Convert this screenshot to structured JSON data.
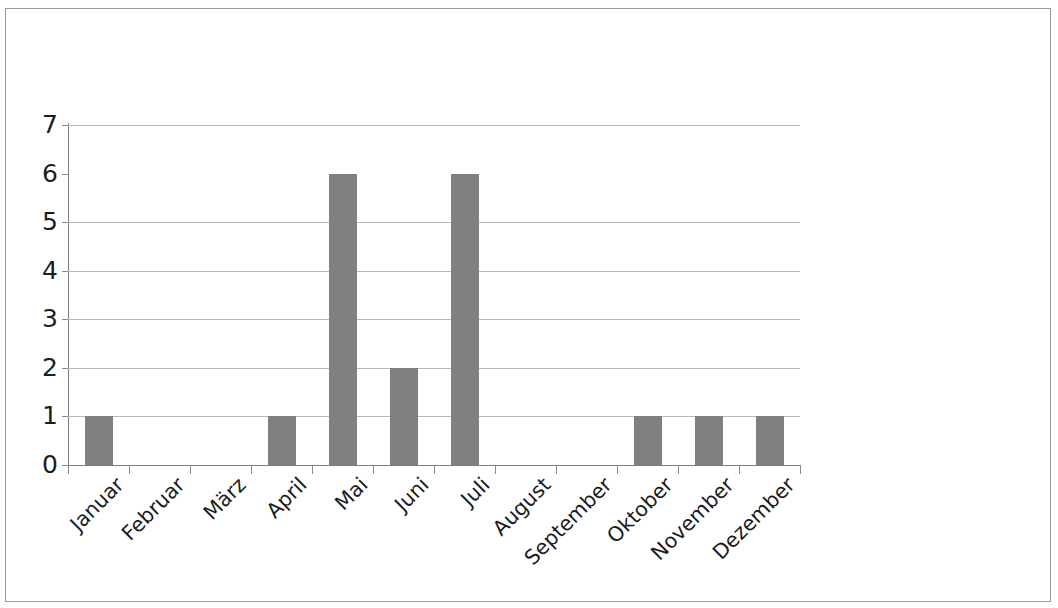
{
  "figure": {
    "background_color": "#ffffff",
    "frame_color": "#9a9a9a",
    "bar_color": "#808080",
    "axis_color": "#7d7d7d",
    "gridline_color": "#b9b9b9",
    "text_color": "#1d1d1d"
  },
  "chart_data": {
    "type": "bar",
    "title": "",
    "subtitle": "",
    "xlabel": "",
    "ylabel": "",
    "categories": [
      "Januar",
      "Februar",
      "März",
      "April",
      "Mai",
      "Juni",
      "Juli",
      "August",
      "September",
      "Oktober",
      "November",
      "Dezember"
    ],
    "values": [
      1,
      0,
      0,
      1,
      6,
      2,
      6,
      0,
      0,
      1,
      1,
      1
    ],
    "ylim": [
      0,
      7
    ],
    "ytick_labels": [
      "0",
      "1",
      "2",
      "3",
      "4",
      "5",
      "6",
      "7"
    ],
    "ytick_values": [
      0,
      1,
      2,
      3,
      4,
      5,
      6,
      7
    ],
    "gridline_values": [
      1,
      2,
      3,
      4,
      5,
      7
    ],
    "grid": true,
    "legend": null,
    "legend_position": "none",
    "annotations": [],
    "xtick_label_rotation": -45
  }
}
